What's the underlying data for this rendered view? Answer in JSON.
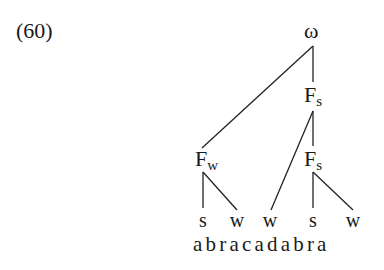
{
  "example_number": "(60)",
  "tree": {
    "root": {
      "label": "ω"
    },
    "foot_strong_upper": {
      "label": "F",
      "sub": "s"
    },
    "foot_weak": {
      "label": "F",
      "sub": "w"
    },
    "foot_strong_lower": {
      "label": "F",
      "sub": "s"
    },
    "leaves": [
      {
        "label": "s"
      },
      {
        "label": "w"
      },
      {
        "label": "w"
      },
      {
        "label": "s"
      },
      {
        "label": "w"
      }
    ]
  },
  "word": "abracadabra"
}
